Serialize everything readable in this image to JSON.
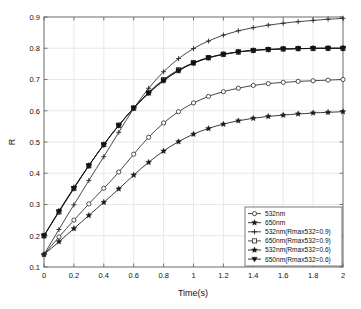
{
  "chart_data": {
    "type": "line",
    "title": "",
    "xlabel": "Time(s)",
    "ylabel": "R",
    "xlim": [
      0,
      2
    ],
    "ylim": [
      0.1,
      0.9
    ],
    "xticks": [
      "0",
      "0.2",
      "0.4",
      "0.6",
      "0.8",
      "1",
      "1.2",
      "1.4",
      "1.6",
      "1.8",
      "2"
    ],
    "xtick_values": [
      0,
      0.2,
      0.4,
      0.6,
      0.8,
      1,
      1.2,
      1.4,
      1.6,
      1.8,
      2
    ],
    "yticks": [
      "0.1",
      "0.2",
      "0.3",
      "0.4",
      "0.5",
      "0.6",
      "0.7",
      "0.8",
      "0.9"
    ],
    "ytick_values": [
      0.1,
      0.2,
      0.3,
      0.4,
      0.5,
      0.6,
      0.7,
      0.8,
      0.9
    ],
    "grid": true,
    "legend_position": "lower right",
    "x": [
      0,
      0.05,
      0.1,
      0.15,
      0.2,
      0.25,
      0.3,
      0.35,
      0.4,
      0.45,
      0.5,
      0.55,
      0.6,
      0.65,
      0.7,
      0.75,
      0.8,
      0.85,
      0.9,
      0.95,
      1,
      1.05,
      1.1,
      1.15,
      1.2,
      1.25,
      1.3,
      1.35,
      1.4,
      1.45,
      1.5,
      1.55,
      1.6,
      1.65,
      1.7,
      1.75,
      1.8,
      1.85,
      1.9,
      1.95,
      2
    ],
    "series": [
      {
        "name": "532nm",
        "marker": "circle-open",
        "color": "#262626",
        "plateau": 0.7,
        "start": 0.14,
        "values": [
          0.14,
          0.168,
          0.196,
          0.223,
          0.25,
          0.276,
          0.302,
          0.327,
          0.352,
          0.377,
          0.404,
          0.432,
          0.461,
          0.489,
          0.515,
          0.539,
          0.561,
          0.58,
          0.597,
          0.612,
          0.625,
          0.636,
          0.646,
          0.654,
          0.661,
          0.667,
          0.672,
          0.677,
          0.681,
          0.684,
          0.687,
          0.689,
          0.691,
          0.692,
          0.694,
          0.695,
          0.696,
          0.697,
          0.698,
          0.699,
          0.7
        ]
      },
      {
        "name": "650nm",
        "marker": "star-filled",
        "color": "#1a1a1a",
        "plateau": 0.6,
        "start": 0.14,
        "values": [
          0.14,
          0.16,
          0.181,
          0.202,
          0.223,
          0.244,
          0.265,
          0.286,
          0.307,
          0.328,
          0.35,
          0.372,
          0.394,
          0.415,
          0.435,
          0.454,
          0.471,
          0.487,
          0.501,
          0.514,
          0.525,
          0.535,
          0.543,
          0.551,
          0.557,
          0.563,
          0.568,
          0.572,
          0.576,
          0.579,
          0.582,
          0.584,
          0.586,
          0.588,
          0.59,
          0.591,
          0.593,
          0.594,
          0.595,
          0.596,
          0.597
        ]
      },
      {
        "name": "532nm(Rmax532=0.9)",
        "marker": "plus",
        "color": "#262626",
        "plateau": 0.9,
        "start": 0.14,
        "values": [
          0.14,
          0.18,
          0.22,
          0.26,
          0.299,
          0.338,
          0.377,
          0.415,
          0.453,
          0.492,
          0.531,
          0.57,
          0.607,
          0.641,
          0.672,
          0.7,
          0.725,
          0.747,
          0.767,
          0.784,
          0.799,
          0.812,
          0.823,
          0.833,
          0.842,
          0.849,
          0.856,
          0.861,
          0.866,
          0.87,
          0.874,
          0.877,
          0.88,
          0.883,
          0.885,
          0.887,
          0.889,
          0.891,
          0.893,
          0.894,
          0.896
        ]
      },
      {
        "name": "650nm(Rmax532=0.9)",
        "marker": "square-open",
        "color": "#262626",
        "plateau": 0.8,
        "start": 0.2,
        "values": [
          0.2,
          0.238,
          0.276,
          0.314,
          0.351,
          0.388,
          0.424,
          0.459,
          0.492,
          0.524,
          0.554,
          0.582,
          0.609,
          0.635,
          0.659,
          0.681,
          0.7,
          0.717,
          0.731,
          0.743,
          0.754,
          0.763,
          0.77,
          0.776,
          0.781,
          0.785,
          0.788,
          0.791,
          0.793,
          0.795,
          0.796,
          0.797,
          0.798,
          0.798,
          0.799,
          0.799,
          0.799,
          0.8,
          0.8,
          0.8,
          0.8
        ]
      },
      {
        "name": "532nm(Rmax532=0.6)",
        "marker": "star-filled",
        "color": "#111111",
        "plateau": 0.8,
        "start": 0.2,
        "values": [
          0.2,
          0.24,
          0.279,
          0.317,
          0.354,
          0.39,
          0.425,
          0.459,
          0.492,
          0.523,
          0.553,
          0.581,
          0.608,
          0.633,
          0.656,
          0.677,
          0.696,
          0.713,
          0.728,
          0.741,
          0.752,
          0.761,
          0.769,
          0.775,
          0.78,
          0.784,
          0.788,
          0.791,
          0.793,
          0.795,
          0.796,
          0.797,
          0.798,
          0.798,
          0.799,
          0.799,
          0.8,
          0.8,
          0.8,
          0.8,
          0.8
        ]
      },
      {
        "name": "650nm(Rmax532=0.6)",
        "marker": "triangle-down",
        "color": "#111111",
        "plateau": 0.8,
        "start": 0.2,
        "values": [
          0.2,
          0.239,
          0.277,
          0.315,
          0.352,
          0.389,
          0.424,
          0.458,
          0.491,
          0.523,
          0.553,
          0.582,
          0.609,
          0.634,
          0.657,
          0.678,
          0.697,
          0.714,
          0.729,
          0.742,
          0.753,
          0.762,
          0.77,
          0.776,
          0.781,
          0.785,
          0.789,
          0.791,
          0.793,
          0.795,
          0.796,
          0.797,
          0.798,
          0.798,
          0.799,
          0.799,
          0.8,
          0.8,
          0.8,
          0.8,
          0.8
        ]
      }
    ],
    "legend_entries": [
      {
        "label": "532nm",
        "marker": "circle-open"
      },
      {
        "label": "650nm",
        "marker": "star-filled"
      },
      {
        "label": "532nm(Rmax532=0.9)",
        "marker": "plus"
      },
      {
        "label": "650nm(Rmax532=0.9)",
        "marker": "square-open"
      },
      {
        "label": "532nm(Rmax532=0.6)",
        "marker": "star-filled"
      },
      {
        "label": "650nm(Rmax532=0.6)",
        "marker": "triangle-down"
      }
    ]
  },
  "style": {
    "line_color": "#262626",
    "grid_color": "#d8d8d8",
    "axis_color": "#5a5a5a",
    "background": "#ffffff"
  }
}
